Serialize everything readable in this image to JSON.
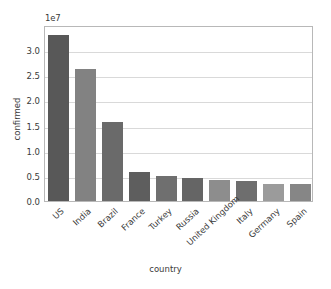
{
  "chart_data": {
    "type": "bar",
    "title": "",
    "subtitle": "",
    "xlabel": "country",
    "ylabel": "confirmed",
    "y_offset_label": "1e7",
    "categories": [
      "US",
      "India",
      "Brazil",
      "France",
      "Turkey",
      "Russia",
      "United Kingdom",
      "Italy",
      "Germany",
      "Spain"
    ],
    "values": [
      33000000,
      26200000,
      15800000,
      5800000,
      5000000,
      4650000,
      4200000,
      3900000,
      3400000,
      3300000
    ],
    "values_scaled_1e7": [
      3.3,
      2.62,
      1.58,
      0.58,
      0.5,
      0.465,
      0.42,
      0.39,
      0.34,
      0.33
    ],
    "bar_colors": [
      "#585858",
      "#828282",
      "#6a6a6a",
      "#5e5e5e",
      "#6f6f6f",
      "#656565",
      "#8d8d8d",
      "#6e6e6e",
      "#9b9b9b",
      "#868686"
    ],
    "ylim": [
      0,
      3.5
    ],
    "ylim_scaled_1e7": [
      0.0,
      3.5
    ],
    "yticks": [
      0.0,
      0.5,
      1.0,
      1.5,
      2.0,
      2.5,
      3.0
    ],
    "ytick_labels": [
      "0.0",
      "0.5",
      "1.0",
      "1.5",
      "2.0",
      "2.5",
      "3.0"
    ],
    "grid": true,
    "grid_axis": "y",
    "grid_color": "#d9d9d9",
    "legend": null,
    "legend_position": "none",
    "xtick_rotation": -43,
    "background_color": "#ffffff",
    "frame_color": "#b8b8b8",
    "text_color": "#3a3a3a"
  }
}
